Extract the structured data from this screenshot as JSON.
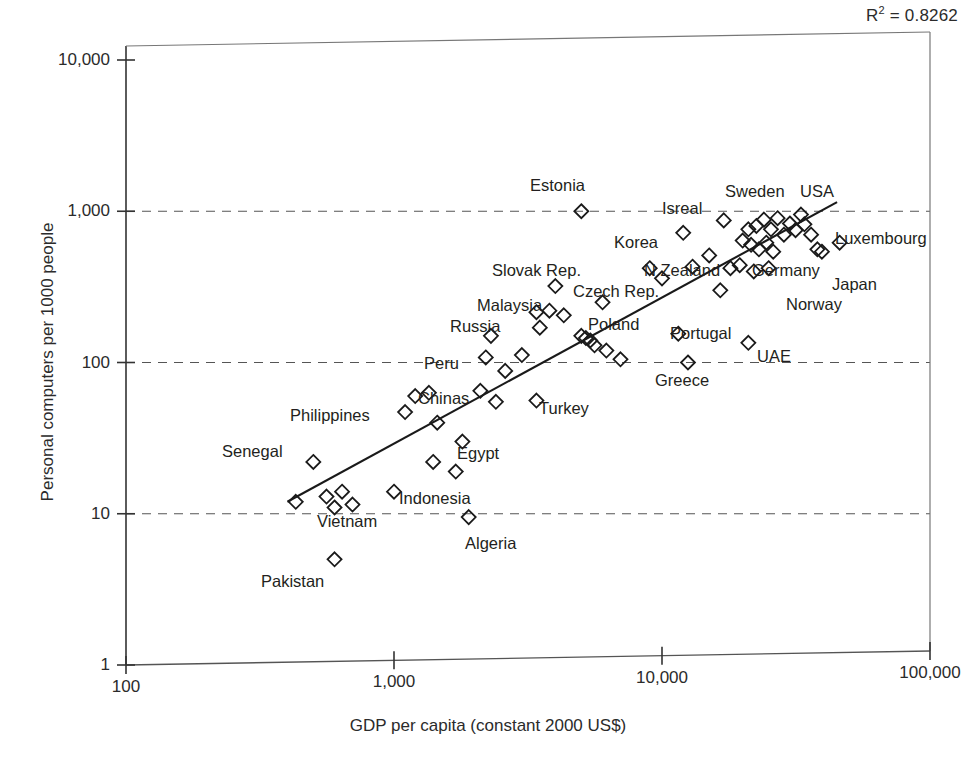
{
  "annotation": {
    "r2_prefix": "R",
    "r2_sup": "2",
    "r2_value": " = 0.8262"
  },
  "chart_data": {
    "type": "scatter",
    "title": "",
    "xlabel": "GDP per capita (constant 2000 US$)",
    "ylabel": "Personal computers per 1000 people",
    "xscale": "log",
    "yscale": "log",
    "xlim": [
      100,
      100000
    ],
    "ylim": [
      1,
      10000
    ],
    "xticks": [
      "100",
      "1,000",
      "10,000",
      "100,000"
    ],
    "xtick_values": [
      100,
      1000,
      10000,
      100000
    ],
    "yticks": [
      "1",
      "10",
      "100",
      "1,000",
      "10,000"
    ],
    "ytick_values": [
      1,
      10,
      100,
      1000,
      10000
    ],
    "grid": "horizontal-dashed",
    "legend": "none",
    "r_squared": 0.8262,
    "marker": "open-diamond",
    "trendline": {
      "type": "linear-on-log-log",
      "x_start": 400,
      "y_start": 12,
      "x_end": 45000,
      "y_end": 1150
    },
    "annotations": [
      {
        "label": "Estonia",
        "x": 5000,
        "y": 1000,
        "lx": 530,
        "ly": 177
      },
      {
        "label": "Isreal",
        "x": 17000,
        "y": 870,
        "lx": 662,
        "ly": 200
      },
      {
        "label": "Sweden",
        "x": 24000,
        "y": 1180,
        "lx": 725,
        "ly": 183
      },
      {
        "label": "USA",
        "x": 34000,
        "y": 1150,
        "lx": 800,
        "ly": 183
      },
      {
        "label": "Korea",
        "x": 12000,
        "y": 720,
        "lx": 614,
        "ly": 234
      },
      {
        "label": "Luxembourg",
        "x": 46000,
        "y": 620,
        "lx": 835,
        "ly": 230
      },
      {
        "label": "Slovak Rep.",
        "x": 4000,
        "y": 320,
        "lx": 492,
        "ly": 262
      },
      {
        "label": "N Zealand",
        "x": 15000,
        "y": 400,
        "lx": 644,
        "ly": 262
      },
      {
        "label": "Germany",
        "x": 24000,
        "y": 430,
        "lx": 752,
        "ly": 262
      },
      {
        "label": "Japan",
        "x": 35000,
        "y": 350,
        "lx": 832,
        "ly": 276
      },
      {
        "label": "Czech Rep.",
        "x": 6000,
        "y": 250,
        "lx": 573,
        "ly": 283
      },
      {
        "label": "Malaysia",
        "x": 3800,
        "y": 220,
        "lx": 477,
        "ly": 297
      },
      {
        "label": "Norway",
        "x": 37000,
        "y": 490,
        "lx": 786,
        "ly": 296
      },
      {
        "label": "Russia",
        "x": 2300,
        "y": 150,
        "lx": 450,
        "ly": 318
      },
      {
        "label": "Poland",
        "x": 5200,
        "y": 145,
        "lx": 588,
        "ly": 316
      },
      {
        "label": "Portugal",
        "x": 11500,
        "y": 155,
        "lx": 670,
        "ly": 325
      },
      {
        "label": "Peru",
        "x": 2200,
        "y": 108,
        "lx": 424,
        "ly": 355
      },
      {
        "label": "UAE",
        "x": 21000,
        "y": 135,
        "lx": 757,
        "ly": 348
      },
      {
        "label": "Greece",
        "x": 12500,
        "y": 100,
        "lx": 655,
        "ly": 372
      },
      {
        "label": "Chinas",
        "x": 1200,
        "y": 60,
        "lx": 418,
        "ly": 390
      },
      {
        "label": "Philippines",
        "x": 1100,
        "y": 47,
        "lx": 290,
        "ly": 407
      },
      {
        "label": "Turkey",
        "x": 3400,
        "y": 56,
        "lx": 539,
        "ly": 400
      },
      {
        "label": "Egypt",
        "x": 1800,
        "y": 30,
        "lx": 457,
        "ly": 445
      },
      {
        "label": "Senegal",
        "x": 500,
        "y": 22,
        "lx": 222,
        "ly": 443
      },
      {
        "label": "Indonesia",
        "x": 1000,
        "y": 14,
        "lx": 399,
        "ly": 490
      },
      {
        "label": "Vietnam",
        "x": 480,
        "y": 12,
        "lx": 317,
        "ly": 513
      },
      {
        "label": "Algeria",
        "x": 1900,
        "y": 9.5,
        "lx": 465,
        "ly": 535
      },
      {
        "label": "Pakistan",
        "x": 600,
        "y": 5,
        "lx": 261,
        "ly": 573
      }
    ],
    "points": [
      {
        "x": 5000,
        "y": 1000
      },
      {
        "x": 17000,
        "y": 870
      },
      {
        "x": 12000,
        "y": 720
      },
      {
        "x": 21000,
        "y": 760
      },
      {
        "x": 22500,
        "y": 800
      },
      {
        "x": 24000,
        "y": 880
      },
      {
        "x": 25500,
        "y": 760
      },
      {
        "x": 27000,
        "y": 900
      },
      {
        "x": 28500,
        "y": 700
      },
      {
        "x": 30000,
        "y": 830
      },
      {
        "x": 31500,
        "y": 750
      },
      {
        "x": 33000,
        "y": 950
      },
      {
        "x": 34000,
        "y": 820
      },
      {
        "x": 36000,
        "y": 700
      },
      {
        "x": 46000,
        "y": 620
      },
      {
        "x": 20000,
        "y": 640
      },
      {
        "x": 21500,
        "y": 600
      },
      {
        "x": 23000,
        "y": 560
      },
      {
        "x": 24500,
        "y": 620
      },
      {
        "x": 26000,
        "y": 540
      },
      {
        "x": 38000,
        "y": 560
      },
      {
        "x": 39500,
        "y": 540
      },
      {
        "x": 15000,
        "y": 510
      },
      {
        "x": 13000,
        "y": 430
      },
      {
        "x": 18000,
        "y": 420
      },
      {
        "x": 19500,
        "y": 440
      },
      {
        "x": 22000,
        "y": 400
      },
      {
        "x": 25000,
        "y": 420
      },
      {
        "x": 4000,
        "y": 320
      },
      {
        "x": 9000,
        "y": 420
      },
      {
        "x": 10000,
        "y": 360
      },
      {
        "x": 16500,
        "y": 300
      },
      {
        "x": 6000,
        "y": 250
      },
      {
        "x": 3400,
        "y": 215
      },
      {
        "x": 3800,
        "y": 220
      },
      {
        "x": 4300,
        "y": 205
      },
      {
        "x": 3500,
        "y": 170
      },
      {
        "x": 5000,
        "y": 150
      },
      {
        "x": 5200,
        "y": 145
      },
      {
        "x": 5400,
        "y": 140
      },
      {
        "x": 5600,
        "y": 130
      },
      {
        "x": 6200,
        "y": 120
      },
      {
        "x": 2300,
        "y": 150
      },
      {
        "x": 11500,
        "y": 155
      },
      {
        "x": 21000,
        "y": 135
      },
      {
        "x": 2200,
        "y": 108
      },
      {
        "x": 3000,
        "y": 112
      },
      {
        "x": 7000,
        "y": 105
      },
      {
        "x": 12500,
        "y": 100
      },
      {
        "x": 2600,
        "y": 88
      },
      {
        "x": 1200,
        "y": 60
      },
      {
        "x": 1350,
        "y": 63
      },
      {
        "x": 2100,
        "y": 65
      },
      {
        "x": 2400,
        "y": 55
      },
      {
        "x": 1100,
        "y": 47
      },
      {
        "x": 3400,
        "y": 56
      },
      {
        "x": 1450,
        "y": 40
      },
      {
        "x": 1800,
        "y": 30
      },
      {
        "x": 500,
        "y": 22
      },
      {
        "x": 1400,
        "y": 22
      },
      {
        "x": 1700,
        "y": 19
      },
      {
        "x": 1000,
        "y": 14
      },
      {
        "x": 430,
        "y": 12
      },
      {
        "x": 560,
        "y": 13
      },
      {
        "x": 600,
        "y": 11
      },
      {
        "x": 640,
        "y": 14
      },
      {
        "x": 700,
        "y": 11.5
      },
      {
        "x": 1900,
        "y": 9.5
      },
      {
        "x": 600,
        "y": 5
      }
    ]
  }
}
